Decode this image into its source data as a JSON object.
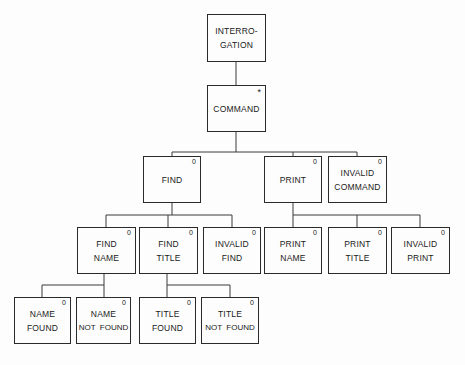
{
  "diagram": {
    "type": "structure-chart",
    "nodes": {
      "interrogation": {
        "lines": [
          "INTERRO-",
          "GATION"
        ],
        "mark": ""
      },
      "command": {
        "lines": [
          "COMMAND"
        ],
        "mark": "*"
      },
      "find": {
        "lines": [
          "FIND"
        ],
        "mark": "0"
      },
      "print": {
        "lines": [
          "PRINT"
        ],
        "mark": "0"
      },
      "invalid_command": {
        "lines": [
          "INVALID",
          "COMMAND"
        ],
        "mark": "0"
      },
      "find_name": {
        "lines": [
          "FIND",
          "NAME"
        ],
        "mark": "0"
      },
      "find_title": {
        "lines": [
          "FIND",
          "TITLE"
        ],
        "mark": "0"
      },
      "invalid_find": {
        "lines": [
          "INVALID",
          "FIND"
        ],
        "mark": "0"
      },
      "print_name": {
        "lines": [
          "PRINT",
          "NAME"
        ],
        "mark": "0"
      },
      "print_title": {
        "lines": [
          "PRINT",
          "TITLE"
        ],
        "mark": "0"
      },
      "invalid_print": {
        "lines": [
          "INVALID",
          "PRINT"
        ],
        "mark": "0"
      },
      "name_found": {
        "lines": [
          "NAME",
          "FOUND"
        ],
        "mark": "0"
      },
      "name_not_found": {
        "lines": [
          "NAME",
          "NOT  FOUND"
        ],
        "mark": "0"
      },
      "title_found": {
        "lines": [
          "TITLE",
          "FOUND"
        ],
        "mark": "0"
      },
      "title_not_found": {
        "lines": [
          "TITLE",
          "NOT  FOUND"
        ],
        "mark": "0"
      }
    },
    "edges": [
      [
        "interrogation",
        "command"
      ],
      [
        "command",
        "find"
      ],
      [
        "command",
        "print"
      ],
      [
        "command",
        "invalid_command"
      ],
      [
        "find",
        "find_name"
      ],
      [
        "find",
        "find_title"
      ],
      [
        "find",
        "invalid_find"
      ],
      [
        "print",
        "print_name"
      ],
      [
        "print",
        "print_title"
      ],
      [
        "print",
        "invalid_print"
      ],
      [
        "find_name",
        "name_found"
      ],
      [
        "find_name",
        "name_not_found"
      ],
      [
        "find_title",
        "title_found"
      ],
      [
        "find_title",
        "title_not_found"
      ]
    ]
  }
}
